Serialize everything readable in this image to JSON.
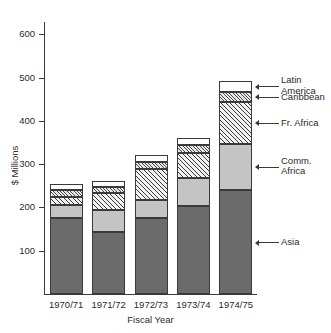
{
  "chart_data": {
    "type": "bar",
    "subtype": "stacked-bar",
    "title": "",
    "xlabel": "Fiscal Year",
    "ylabel": "$ Millions",
    "categories": [
      "1970/71",
      "1971/72",
      "1972/73",
      "1973/74",
      "1974/75"
    ],
    "ylim": [
      0,
      640
    ],
    "yticks": [
      100,
      200,
      300,
      400,
      500,
      600
    ],
    "grid": false,
    "legend_position": "right-callouts",
    "series": [
      {
        "name": "Asia",
        "values": [
          175,
          143,
          175,
          203,
          241
        ]
      },
      {
        "name": "Comm. Africa",
        "values": [
          30,
          50,
          43,
          65,
          105
        ]
      },
      {
        "name": "Fr. Africa",
        "values": [
          18,
          40,
          70,
          58,
          98
        ]
      },
      {
        "name": "Caribbean",
        "values": [
          18,
          15,
          18,
          17,
          23
        ]
      },
      {
        "name": "Latin America",
        "values": [
          13,
          12,
          16,
          18,
          25
        ]
      }
    ],
    "totals": [
      254,
      260,
      322,
      361,
      492
    ]
  },
  "axes": {
    "y_title": "$ Millions",
    "x_title": "Fiscal Year",
    "y_tick_labels": [
      "600",
      "500",
      "400",
      "300",
      "200",
      "100"
    ],
    "x_tick_labels": [
      "1970/71",
      "1971/72",
      "1972/73",
      "1973/74",
      "1974/75"
    ]
  },
  "callouts": [
    {
      "key": "latin",
      "label": "Latin\nAmerica"
    },
    {
      "key": "caribbean",
      "label": "Caribbean"
    },
    {
      "key": "fr_africa",
      "label": "Fr. Africa"
    },
    {
      "key": "comm",
      "label": "Comm.\nAfrica"
    },
    {
      "key": "asia",
      "label": "Asia"
    }
  ],
  "colors": {
    "asia": "#6b6b6b",
    "comm_africa": "#c4c4c4",
    "fr_africa": "#f2f2f2",
    "caribbean": "#e8e8e8",
    "latin_america": "#ffffff",
    "outline": "#3a3a3a",
    "text": "#2b2b2b"
  }
}
